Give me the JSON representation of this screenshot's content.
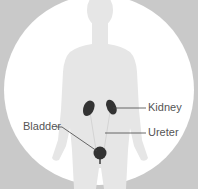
{
  "diagram": {
    "labels": {
      "kidney": "Kidney",
      "ureter": "Ureter",
      "bladder": "Bladder"
    },
    "colors": {
      "background": "#c9c9c9",
      "circle": "#ffffff",
      "silhouette": "#e6e6e6",
      "organ": "#333333",
      "leader_line": "#444444",
      "label_text": "#555555"
    }
  }
}
